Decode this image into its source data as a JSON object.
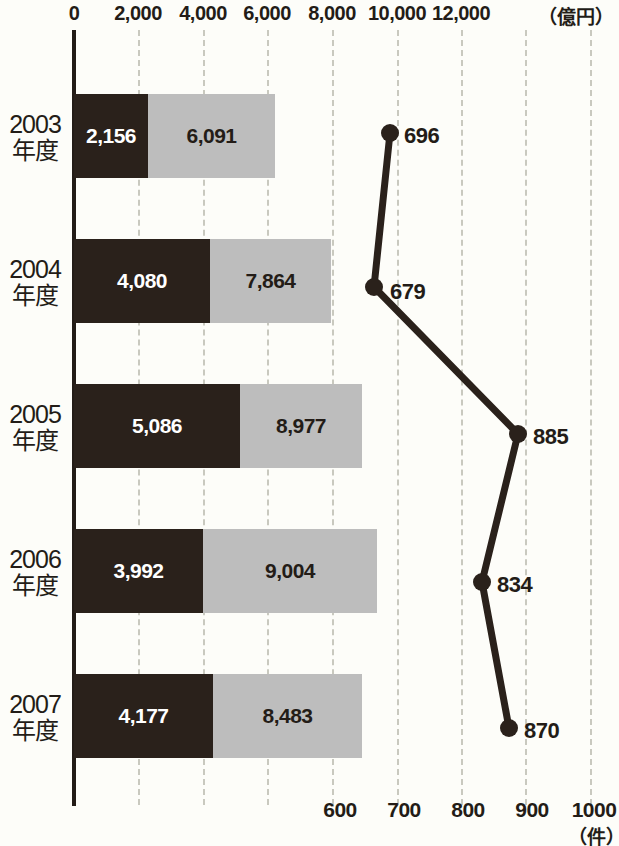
{
  "chart_data": {
    "type": "bar",
    "title": "",
    "categories": [
      "2003年度",
      "2004年度",
      "2005年度",
      "2006年度",
      "2007年度"
    ],
    "series": [
      {
        "name": "dark-segment",
        "values": [
          2156,
          4080,
          5086,
          3992,
          4177
        ],
        "labels": [
          "2,156",
          "4,080",
          "5,086",
          "3,992",
          "4,177"
        ],
        "color": "#2a211b"
      },
      {
        "name": "light-segment",
        "values": [
          6091,
          7864,
          8977,
          9004,
          8483
        ],
        "labels": [
          "6,091",
          "7,864",
          "8,977",
          "9,004",
          "8,483"
        ],
        "color": "#bdbdbd"
      },
      {
        "name": "line-count",
        "type": "line",
        "values": [
          696,
          679,
          885,
          834,
          870
        ],
        "labels": [
          "696",
          "679",
          "885",
          "834",
          "870"
        ],
        "color": "#2a211b"
      }
    ],
    "totals": [
      8247,
      11944,
      14063,
      12996,
      12660
    ],
    "xlabel": "",
    "ylabel": "",
    "top_axis": {
      "unit": "（億円）",
      "ticks": [
        "0",
        "2,000",
        "4,000",
        "6,000",
        "8,000",
        "10,000",
        "12,000"
      ],
      "tick_values": [
        0,
        2000,
        4000,
        6000,
        8000,
        10000,
        12000
      ],
      "range": [
        0,
        16000
      ]
    },
    "bottom_axis": {
      "unit": "（件）",
      "ticks": [
        "600",
        "700",
        "800",
        "900",
        "1000"
      ],
      "tick_values": [
        600,
        700,
        800,
        900,
        1000
      ],
      "range": [
        600,
        1000
      ]
    },
    "grid": true,
    "legend": "none"
  },
  "top_axis_labels": [
    {
      "text": "0",
      "x": 74
    },
    {
      "text": "2,000",
      "x": 138
    },
    {
      "text": "4,000",
      "x": 203
    },
    {
      "text": "6,000",
      "x": 267
    },
    {
      "text": "8,000",
      "x": 332
    },
    {
      "text": "10,000",
      "x": 397
    },
    {
      "text": "12,000",
      "x": 461
    }
  ],
  "top_unit": {
    "text": "（億円）",
    "x": 538
  },
  "bottom_axis_labels": [
    {
      "text": "600",
      "x": 340
    },
    {
      "text": "700",
      "x": 404
    },
    {
      "text": "800",
      "x": 468
    },
    {
      "text": "900",
      "x": 532
    },
    {
      "text": "1000",
      "x": 594
    }
  ],
  "bottom_unit": {
    "text": "（件）",
    "x": 568
  },
  "gridlines_x": [
    138,
    203,
    267,
    332,
    397,
    461,
    525,
    590
  ],
  "rows": [
    {
      "label_year": "2003",
      "label_suffix": "年度",
      "label_top": 110,
      "bar_top": 94,
      "bar_height": 84,
      "dark": {
        "label": "2,156",
        "left": 74,
        "width": 74
      },
      "light": {
        "label": "6,091",
        "left": 148,
        "width": 127
      }
    },
    {
      "label_year": "2004",
      "label_suffix": "年度",
      "label_top": 255,
      "bar_top": 239,
      "bar_height": 84,
      "dark": {
        "label": "4,080",
        "left": 74,
        "width": 136
      },
      "light": {
        "label": "7,864",
        "left": 210,
        "width": 121
      }
    },
    {
      "label_year": "2005",
      "label_suffix": "年度",
      "label_top": 400,
      "bar_top": 384,
      "bar_height": 84,
      "dark": {
        "label": "5,086",
        "left": 74,
        "width": 166
      },
      "light": {
        "label": "8,977",
        "left": 240,
        "width": 122
      }
    },
    {
      "label_year": "2006",
      "label_suffix": "年度",
      "label_top": 545,
      "bar_top": 529,
      "bar_height": 84,
      "dark": {
        "label": "3,992",
        "left": 74,
        "width": 129
      },
      "light": {
        "label": "9,004",
        "left": 203,
        "width": 174
      }
    },
    {
      "label_year": "2007",
      "label_suffix": "年度",
      "label_top": 690,
      "bar_top": 674,
      "bar_height": 84,
      "dark": {
        "label": "4,177",
        "left": 74,
        "width": 139
      },
      "light": {
        "label": "8,483",
        "left": 213,
        "width": 149
      }
    }
  ],
  "line_points": [
    {
      "label": "696",
      "cx": 390,
      "cy": 133,
      "lx": 404,
      "ly": 136,
      "side": "right"
    },
    {
      "label": "679",
      "cx": 374,
      "cy": 287,
      "lx": 390,
      "ly": 292,
      "side": "right"
    },
    {
      "label": "885",
      "cx": 518,
      "cy": 434,
      "lx": 533,
      "ly": 437,
      "side": "right"
    },
    {
      "label": "834",
      "cx": 482,
      "cy": 582,
      "lx": 497,
      "ly": 585,
      "side": "right"
    },
    {
      "label": "870",
      "cx": 509,
      "cy": 728,
      "lx": 524,
      "ly": 731,
      "side": "right"
    }
  ],
  "line_style": {
    "color": "#2a211b",
    "width": 7,
    "dot_radius": 9
  }
}
